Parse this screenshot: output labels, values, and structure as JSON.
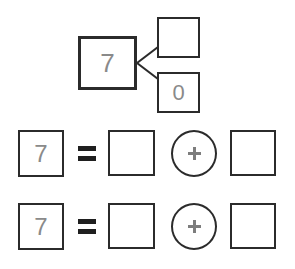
{
  "worksheet": {
    "background_color": "#ffffff",
    "ink_color": "#2b2b2b",
    "digit_color": "#8a8a8a"
  },
  "number_bond": {
    "whole": "7",
    "part_top": "",
    "part_bottom": "0"
  },
  "equations": [
    {
      "left": "7",
      "equals": "=",
      "addend_1": "",
      "operator": "+",
      "addend_2": ""
    },
    {
      "left": "7",
      "equals": "=",
      "addend_1": "",
      "operator": "+",
      "addend_2": ""
    }
  ]
}
